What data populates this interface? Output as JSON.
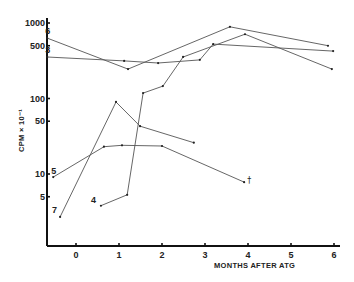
{
  "chart_data": {
    "type": "line",
    "title": "",
    "xlabel": "MONTHS AFTER ATG",
    "ylabel": "CPM × 10⁻¹",
    "yscale": "log",
    "xlim": [
      -0.7,
      6.2
    ],
    "ylim": [
      1,
      1000
    ],
    "x_ticks": [
      0,
      1,
      2,
      3,
      4,
      5,
      6
    ],
    "x_tick_labels": [
      "0",
      "1",
      "2",
      "3",
      "4",
      "5",
      "6"
    ],
    "y_ticks": [
      5,
      10,
      50,
      100,
      500,
      1000
    ],
    "y_tick_labels": [
      "5",
      "10",
      "50",
      "100",
      "500",
      "1000"
    ],
    "grid": false,
    "legend": "none (series labeled inline at start points)",
    "series": [
      {
        "name": "6",
        "x": [
          -0.67,
          1.21,
          3.58,
          5.86
        ],
        "y": [
          630,
          245,
          890,
          500
        ]
      },
      {
        "name": "3",
        "x": [
          -0.67,
          1.12,
          1.91,
          2.88,
          3.19,
          5.98
        ],
        "y": [
          355,
          315,
          295,
          325,
          525,
          425
        ]
      },
      {
        "name": "4",
        "x": [
          0.58,
          1.19,
          1.56,
          2.02,
          2.49,
          3.93,
          5.95
        ],
        "y": [
          3.8,
          5.3,
          118,
          146,
          355,
          710,
          245
        ]
      },
      {
        "name": "7",
        "x": [
          -0.37,
          0.93,
          1.49,
          2.74
        ],
        "y": [
          2.7,
          90,
          43,
          26
        ]
      },
      {
        "name": "5",
        "x": [
          -0.53,
          0.65,
          1.07,
          2.0,
          3.91
        ],
        "y": [
          9.1,
          23,
          24,
          23.5,
          7.8
        ]
      }
    ],
    "annotations": [
      {
        "text": "†",
        "series": "5",
        "at_x": 3.91,
        "note": "marker after last point of series 5"
      }
    ]
  },
  "layout": {
    "plot": {
      "x0_px": 76,
      "px_per_month": 43,
      "y_axis_px": 47,
      "x_axis_px": 246,
      "y_at_1000_px": 23,
      "px_per_decade": 75.5,
      "x_axis_end_px": 340,
      "y_axis_top_px": 18
    },
    "series_label_offsets": {
      "6": [
        -2,
        -4
      ],
      "3": [
        -2,
        -4
      ],
      "4": [
        -10,
        -3
      ],
      "7": [
        -8,
        -4
      ],
      "5": [
        -2,
        -3
      ]
    }
  }
}
